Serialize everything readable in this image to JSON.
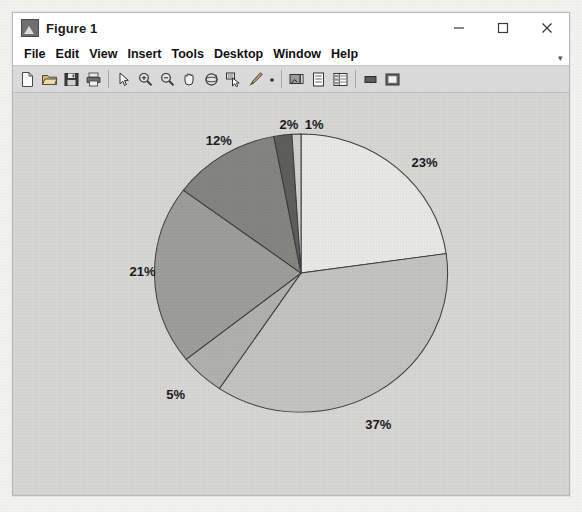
{
  "window": {
    "title": "Figure 1",
    "app_icon": "matlab-figure-icon",
    "controls": [
      {
        "name": "minimize",
        "glyph": "−"
      },
      {
        "name": "maximize",
        "glyph": "□"
      },
      {
        "name": "close",
        "glyph": "×"
      }
    ]
  },
  "menu": {
    "items": [
      {
        "label": "File"
      },
      {
        "label": "Edit"
      },
      {
        "label": "View"
      },
      {
        "label": "Insert"
      },
      {
        "label": "Tools"
      },
      {
        "label": "Desktop"
      },
      {
        "label": "Window"
      },
      {
        "label": "Help"
      }
    ],
    "overflow_glyph": "▾"
  },
  "toolbar": {
    "buttons": [
      {
        "name": "new-figure-icon",
        "tip": "New Figure"
      },
      {
        "name": "open-file-icon",
        "tip": "Open File"
      },
      {
        "name": "save-figure-icon",
        "tip": "Save Figure"
      },
      {
        "name": "print-figure-icon",
        "tip": "Print Figure"
      },
      {
        "name": "separator-1",
        "tip": ""
      },
      {
        "name": "edit-plot-pointer-icon",
        "tip": "Edit Plot"
      },
      {
        "name": "zoom-in-icon",
        "tip": "Zoom In"
      },
      {
        "name": "zoom-out-icon",
        "tip": "Zoom Out"
      },
      {
        "name": "pan-hand-icon",
        "tip": "Pan"
      },
      {
        "name": "rotate-3d-icon",
        "tip": "Rotate 3D"
      },
      {
        "name": "data-cursor-icon",
        "tip": "Data Cursor"
      },
      {
        "name": "brush-icon",
        "tip": "Brush/Select Data"
      },
      {
        "name": "link-data-dot-icon",
        "tip": "Link Plot"
      },
      {
        "name": "separator-2",
        "tip": ""
      },
      {
        "name": "insert-colorbar-icon",
        "tip": "Insert Colorbar"
      },
      {
        "name": "insert-legend-icon",
        "tip": "Insert Legend"
      },
      {
        "name": "plot-browser-icon",
        "tip": "Plot Browser"
      },
      {
        "name": "separator-3",
        "tip": ""
      },
      {
        "name": "hide-plot-tools-icon",
        "tip": "Hide Plot Tools"
      },
      {
        "name": "show-plot-tools-icon",
        "tip": "Show Plot Tools"
      }
    ]
  },
  "chart_data": {
    "type": "pie",
    "title": "",
    "xlabel": "",
    "ylabel": "",
    "legend": "none",
    "grid": false,
    "start_angle_deg": 90,
    "direction": "clockwise",
    "label_format": "percent",
    "center": {
      "x": 300,
      "y": 281
    },
    "radius": 146,
    "labels": [
      "23%",
      "37%",
      "5%",
      "21%",
      "12%",
      "2%",
      "1%"
    ],
    "values": [
      23,
      37,
      5,
      21,
      12,
      2,
      1
    ],
    "colors": [
      "#e8e8e6",
      "#c3c3c1",
      "#b0b0ae",
      "#9d9d9b",
      "#848482",
      "#5e5e5c",
      "#cfcfcd"
    ],
    "edge_color": "#3c3c3c",
    "slices": [
      {
        "label": "23%",
        "value": 23,
        "color": "#e8e8e6",
        "label_x": 423,
        "label_y": 166
      },
      {
        "label": "37%",
        "value": 37,
        "color": "#c3c3c1",
        "label_x": 377,
        "label_y": 441
      },
      {
        "label": "5%",
        "value": 5,
        "color": "#b0b0ae",
        "label_x": 175,
        "label_y": 410
      },
      {
        "label": "21%",
        "value": 21,
        "color": "#9d9d9b",
        "label_x": 142,
        "label_y": 281
      },
      {
        "label": "12%",
        "value": 12,
        "color": "#848482",
        "label_x": 218,
        "label_y": 143
      },
      {
        "label": "2%",
        "value": 2,
        "color": "#5e5e5c",
        "label_x": 288,
        "label_y": 126
      },
      {
        "label": "1%",
        "value": 1,
        "color": "#cfcfcd",
        "label_x": 313,
        "label_y": 126
      }
    ]
  }
}
